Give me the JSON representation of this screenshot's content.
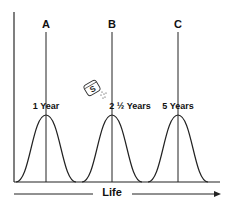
{
  "diagram": {
    "x_axis_label": "Life",
    "peaks": [
      {
        "letter": "A",
        "label": "1 Year"
      },
      {
        "letter": "B",
        "label": "2 ½ Years"
      },
      {
        "letter": "C",
        "label": "5 Years"
      }
    ],
    "icon": "salt-shaker-icon",
    "icon_letter": "S"
  }
}
